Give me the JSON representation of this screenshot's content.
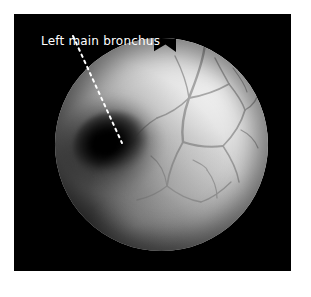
{
  "figure": {
    "type": "bronchoscopy-endoscopic-photograph",
    "background_color": "#ffffff",
    "panel_background_color": "#000000"
  },
  "annotation": {
    "label": "Left main bronchus",
    "text_color": "#ffffff",
    "leader_line": {
      "style": "dotted",
      "color": "#ffffff",
      "start_x": 73,
      "start_y": 36,
      "end_x": 122,
      "end_y": 143
    }
  },
  "endoscope_field": {
    "shape": "circle",
    "center_x": 161,
    "center_y": 144,
    "radius": 106,
    "notch": "top-center-v-notch"
  },
  "anatomy": {
    "lumen_name": "left-main-bronchus-lumen",
    "lumen_center_x": 95,
    "lumen_center_y": 137,
    "mucosa_description": "bronchial mucosa with submucosal vasculature",
    "vasculature_region": "upper-right"
  }
}
